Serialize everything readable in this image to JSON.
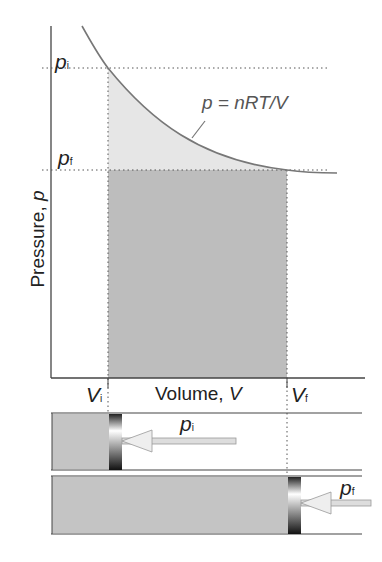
{
  "diagram": {
    "y_axis_label": "Pressure, ",
    "y_axis_symbol": "p",
    "x_axis_label": "Volume, ",
    "x_axis_symbol": "V",
    "equation": "p = nRT/V",
    "labels": {
      "pi": {
        "main": "p",
        "sub": "i"
      },
      "pf": {
        "main": "p",
        "sub": "f"
      },
      "Vi": {
        "main": "V",
        "sub": "i"
      },
      "Vf": {
        "main": "V",
        "sub": "f"
      }
    },
    "cylinders": [
      {
        "state": "initial",
        "pressure_label": {
          "main": "p",
          "sub": "i"
        }
      },
      {
        "state": "final",
        "pressure_label": {
          "main": "p",
          "sub": "f"
        }
      }
    ],
    "colors": {
      "curve": "#777777",
      "work_area_light": "#e6e6e6",
      "work_area_dark": "#bdbdbd",
      "gas": "#c4c4c4",
      "axis": "#444444"
    }
  }
}
